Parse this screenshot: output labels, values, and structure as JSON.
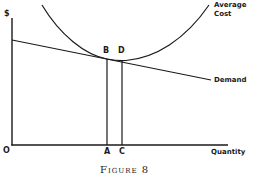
{
  "figure": {
    "caption": "Figure 8",
    "y_axis_label": "$",
    "x_axis_label": "Quantity",
    "origin_label": "O",
    "curves": {
      "average_cost": {
        "label_line1": "Average",
        "label_line2": "Cost",
        "shape": "U-shaped"
      },
      "demand": {
        "label": "Demand",
        "shape": "downward-sloping line"
      }
    },
    "points": {
      "B": "B",
      "D": "D",
      "A": "A",
      "C": "C"
    },
    "colors": {
      "ink": "#1a1a1a",
      "background": "#ffffff"
    }
  }
}
